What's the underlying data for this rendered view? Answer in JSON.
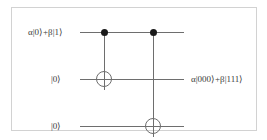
{
  "figure": {
    "frame_color": "#d2d2d2",
    "wire_color": "#6e6e6e",
    "dot_color": "#1a1a1a",
    "text_color": "#3a3a3a",
    "background": "#ffffff"
  },
  "circuit": {
    "wires": [
      {
        "id": "q0",
        "input_label": "α|0⟩+β|1⟩"
      },
      {
        "id": "q1",
        "input_label": "|0⟩"
      },
      {
        "id": "q2",
        "input_label": "|0⟩"
      }
    ],
    "gates": [
      {
        "id": "cnot1",
        "type": "cnot",
        "control_wire": "q0",
        "target_wire": "q1",
        "control_glyph": "control-dot",
        "target_glyph": "xor-target-circle"
      },
      {
        "id": "cnot2",
        "type": "cnot",
        "control_wire": "q0",
        "target_wire": "q2",
        "control_glyph": "control-dot",
        "target_glyph": "xor-target-circle"
      }
    ],
    "output_label": "α|000⟩+β|111⟩"
  }
}
